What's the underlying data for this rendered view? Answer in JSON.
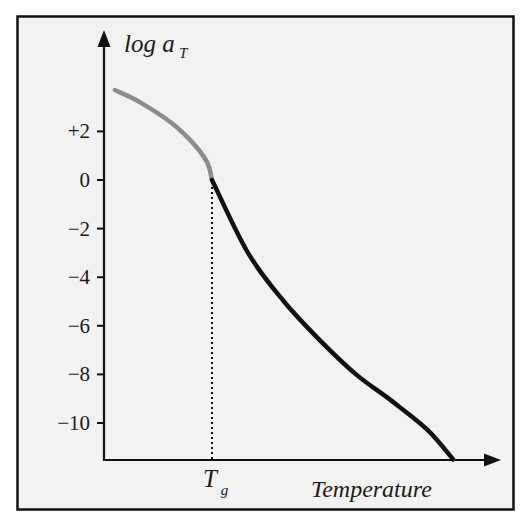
{
  "chart_data": {
    "type": "line",
    "title": "",
    "xlabel": "Temperature",
    "ylabel": "log a_T",
    "ylabel_main": "log a",
    "ylabel_sub": "T",
    "x_marker": {
      "label_main": "T",
      "label_sub": "g",
      "description": "glass transition temperature",
      "y_at_marker": 0
    },
    "yticks": [
      2,
      0,
      -2,
      -4,
      -6,
      -8,
      -10
    ],
    "ytick_labels": [
      "+2",
      "0",
      "−2",
      "−4",
      "−6",
      "−8",
      "−10"
    ],
    "ylim": [
      -11.5,
      5.8
    ],
    "xlim": [
      0,
      1
    ],
    "grid": false,
    "legend": null,
    "series": [
      {
        "name": "below Tg (gray segment)",
        "color": "#8c8c8c",
        "x": [
          0.03,
          0.1,
          0.2,
          0.28,
          0.3
        ],
        "values": [
          3.7,
          3.2,
          2.2,
          0.9,
          0.0
        ]
      },
      {
        "name": "above Tg (black segment)",
        "color": "#111111",
        "x": [
          0.3,
          0.4,
          0.5,
          0.6,
          0.7,
          0.8,
          0.9,
          0.97
        ],
        "values": [
          0.0,
          -3.0,
          -5.0,
          -6.6,
          -8.0,
          -9.1,
          -10.3,
          -11.5
        ]
      }
    ]
  },
  "colors": {
    "frame": "#111111",
    "background": "#f2f2f2",
    "axis": "#111111",
    "curve_low": "#8c8c8c",
    "curve_high": "#111111"
  }
}
